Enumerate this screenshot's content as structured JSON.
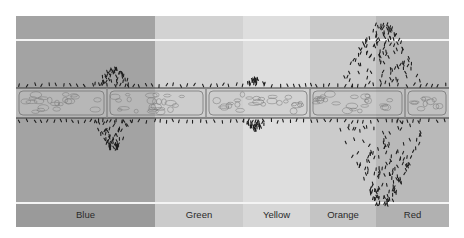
{
  "figure": {
    "bands": [
      {
        "label": "Blue",
        "x": 0,
        "width": 139,
        "shade": "#a3a3a3",
        "label_shade": "#9a9a9a"
      },
      {
        "label": "Green",
        "x": 139,
        "width": 88,
        "shade": "#d2d2d2",
        "label_shade": "#cbcbcb"
      },
      {
        "label": "Yellow",
        "x": 227,
        "width": 67,
        "shade": "#dedede",
        "label_shade": "#d7d7d7"
      },
      {
        "label": "Orange",
        "x": 294,
        "width": 66,
        "shade": "#cbcbcb",
        "label_shade": "#c4c4c4"
      },
      {
        "label": "Red",
        "x": 360,
        "width": 73,
        "shade": "#b9b9b9",
        "label_shade": "#b1b1b1"
      }
    ],
    "filament": {
      "top": 72,
      "bottom": 102,
      "cell_dividers": [
        91,
        190,
        294,
        389
      ],
      "fill": "#c9c9c9",
      "outline": "#3a3a3a"
    },
    "bacteria_clusters": [
      {
        "center_x": 98,
        "above_height": 18,
        "below_height": 30,
        "density": 0.35,
        "spread": 22
      },
      {
        "center_x": 240,
        "above_height": 8,
        "below_height": 10,
        "density": 0.15,
        "spread": 14
      },
      {
        "center_x": 367,
        "above_height": 62,
        "below_height": 86,
        "density": 1.0,
        "spread": 48
      }
    ],
    "guide_lines_y": [
      23,
      186
    ]
  }
}
